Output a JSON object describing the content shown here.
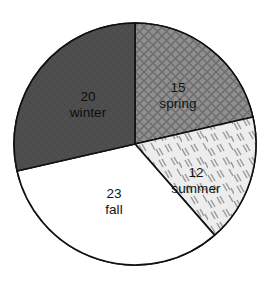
{
  "chart_data": {
    "type": "pie",
    "title": "",
    "subtitle": "",
    "xlabel": "",
    "ylabel": "",
    "legend_position": "none",
    "grid": false,
    "total": 70,
    "units": "count",
    "start_angle_deg": 0,
    "direction": "clockwise",
    "categories": [
      "spring",
      "summer",
      "fall",
      "winter"
    ],
    "values": [
      15,
      12,
      23,
      20
    ],
    "slices": [
      {
        "label": "spring",
        "value": 15,
        "value_text": "15",
        "label_text": "spring",
        "start_deg": 0,
        "end_deg": 77.14,
        "fill": "#8f8f8f",
        "pattern": "cross-hatch",
        "stroke": "#101010",
        "label_fill": "#131313"
      },
      {
        "label": "summer",
        "value": 12,
        "value_text": "12",
        "label_text": "summer",
        "start_deg": 77.14,
        "end_deg": 138.86,
        "fill": "#e8e8e8",
        "pattern": "scattered-dashes",
        "stroke": "#101010",
        "label_fill": "#131313"
      },
      {
        "label": "fall",
        "value": 23,
        "value_text": "23",
        "label_text": "fall",
        "start_deg": 138.86,
        "end_deg": 257.14,
        "fill": "#ffffff",
        "pattern": "none",
        "stroke": "#101010",
        "label_fill": "#131313"
      },
      {
        "label": "winter",
        "value": 20,
        "value_text": "20",
        "label_text": "winter",
        "start_deg": 257.14,
        "end_deg": 360,
        "fill": "#4d4d4d",
        "pattern": "solid-dark",
        "stroke": "#101010",
        "label_fill": "#111111"
      }
    ],
    "geometry": {
      "center_x": 135,
      "center_y": 144,
      "radius": 121
    },
    "label_positions": [
      {
        "label": "spring",
        "value_x": 178,
        "value_y": 88,
        "name_x": 178,
        "name_y": 104
      },
      {
        "label": "summer",
        "value_x": 196,
        "value_y": 173,
        "name_x": 196,
        "name_y": 189
      },
      {
        "label": "fall",
        "value_x": 114,
        "value_y": 194,
        "name_x": 114,
        "name_y": 210
      },
      {
        "label": "winter",
        "value_x": 88,
        "value_y": 97,
        "name_x": 88,
        "name_y": 113
      }
    ]
  },
  "colors": {
    "background": "#ffffff",
    "outline": "#101010",
    "winter_fill": "#4d4d4d",
    "spring_fill": "#8f8f8f",
    "summer_fill": "#e8e8e8",
    "fall_fill": "#ffffff"
  }
}
